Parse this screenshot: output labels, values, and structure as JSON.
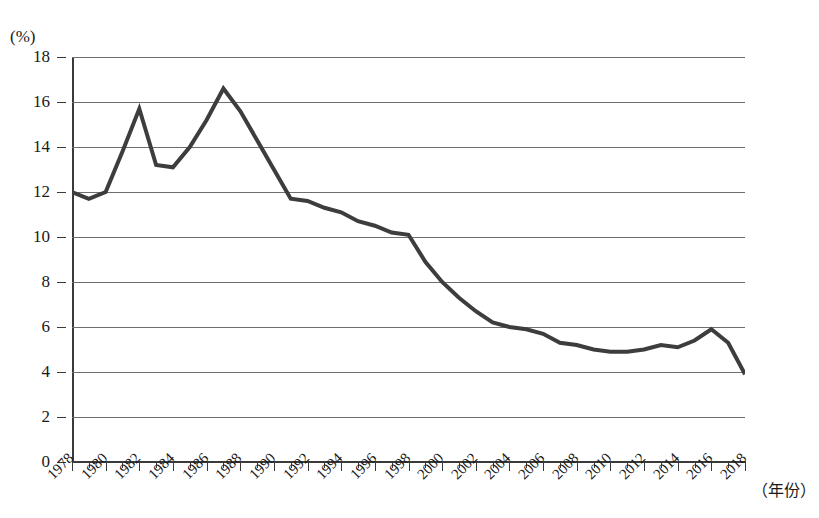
{
  "chart_data": {
    "type": "line",
    "title": "",
    "subtitle": "",
    "unit_label": "(%)",
    "xlabel": "（年份）",
    "ylabel": "",
    "ylim": [
      0,
      18
    ],
    "ytick_step": 2,
    "yticks": [
      "0",
      "2",
      "4",
      "6",
      "8",
      "10",
      "12",
      "14",
      "16",
      "18"
    ],
    "xlim": [
      1978,
      2018
    ],
    "xtick_step": 2,
    "grid": "horizontal",
    "legend": "none",
    "line_color": "#3d3d3d",
    "line_width": 4,
    "x": [
      1978,
      1979,
      1980,
      1981,
      1982,
      1983,
      1984,
      1985,
      1986,
      1987,
      1988,
      1989,
      1990,
      1991,
      1992,
      1993,
      1994,
      1995,
      1996,
      1997,
      1998,
      1999,
      2000,
      2001,
      2002,
      2003,
      2004,
      2005,
      2006,
      2007,
      2008,
      2009,
      2010,
      2011,
      2012,
      2013,
      2014,
      2015,
      2016,
      2017,
      2018
    ],
    "values": [
      12.0,
      11.7,
      12.0,
      13.8,
      15.7,
      13.2,
      13.1,
      14.0,
      15.2,
      16.6,
      15.6,
      14.3,
      13.0,
      11.7,
      11.6,
      11.3,
      11.1,
      10.7,
      10.5,
      10.2,
      10.1,
      8.9,
      8.0,
      7.3,
      6.7,
      6.2,
      6.0,
      5.9,
      5.7,
      5.3,
      5.2,
      5.0,
      4.9,
      4.9,
      5.0,
      5.2,
      5.1,
      5.4,
      5.9,
      5.3,
      3.9
    ],
    "xtick_labels": [
      "1978",
      "1980",
      "1982",
      "1984",
      "1986",
      "1988",
      "1990",
      "1992",
      "1994",
      "1996",
      "1998",
      "2000",
      "2002",
      "2004",
      "2006",
      "2008",
      "2010",
      "2012",
      "2014",
      "2016",
      "2018"
    ]
  }
}
